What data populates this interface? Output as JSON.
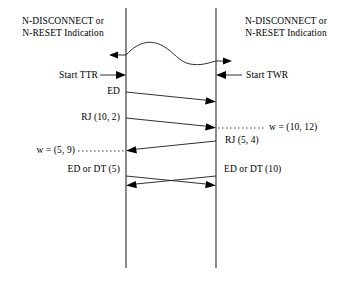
{
  "diagram": {
    "type": "sequence-diagram",
    "background_color": "#ffffff",
    "line_color": "#1a1a1a",
    "text_color": "#000000",
    "lifelines": [
      {
        "id": "left",
        "x": 126,
        "y_top": 8,
        "y_bottom": 268
      },
      {
        "id": "right",
        "x": 216,
        "y_top": 8,
        "y_bottom": 268
      }
    ],
    "headers": {
      "left": {
        "line1": "N-DISCONNECT or",
        "line2": "N-RESET Indication"
      },
      "right": {
        "line1": "N-DISCONNECT or",
        "line2": "N-RESET Indication"
      }
    },
    "events": [
      {
        "id": "disconnect-wave",
        "kind": "wave",
        "note": "wavy line between lifelines with outward arrows at both ends",
        "left_arrow_direction": "left",
        "right_arrow_direction": "right",
        "left_label": "",
        "right_label": ""
      },
      {
        "id": "start-ttr",
        "kind": "external-arrow-left-side",
        "label": "Start TTR",
        "direction": "right"
      },
      {
        "id": "start-twr",
        "kind": "external-arrow-right-side",
        "label": "Start TWR",
        "direction": "left"
      },
      {
        "id": "ed",
        "kind": "message",
        "label": "ED",
        "direction": "left-to-right"
      },
      {
        "id": "rj-10-2",
        "kind": "message",
        "label": "RJ (10, 2)",
        "direction": "left-to-right",
        "annotation": "w = (10, 12)",
        "annotation_side": "right"
      },
      {
        "id": "rj-5-4",
        "kind": "message",
        "label": "RJ (5, 4)",
        "direction": "right-to-left",
        "annotation": "w = (5, 9)",
        "annotation_side": "left"
      },
      {
        "id": "ed-or-dt-crossing",
        "kind": "crossing-messages",
        "left_label": "ED or DT (5)",
        "right_label": "ED or DT (10)"
      }
    ],
    "labels": {
      "start_ttr": "Start TTR",
      "start_twr": "Start TWR",
      "ed": "ED",
      "rj_10_2": "RJ (10, 2)",
      "w_10_12": "w = (10, 12)",
      "w_5_9": "w = (5, 9)",
      "rj_5_4": "RJ (5, 4)",
      "ed_or_dt_5": "ED or DT (5)",
      "ed_or_dt_10": "ED or DT (10)"
    }
  }
}
